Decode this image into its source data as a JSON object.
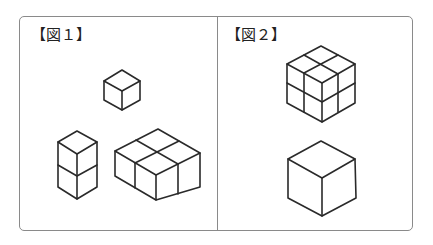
{
  "panels": [
    {
      "label": "【図１】",
      "figures": [
        {
          "name": "single-cube",
          "cubes": 1
        },
        {
          "name": "two-cube-column",
          "cubes": 2,
          "arrangement": "1x1x2"
        },
        {
          "name": "four-cube-slab",
          "cubes": 4,
          "arrangement": "2x2x1"
        }
      ]
    },
    {
      "label": "【図２】",
      "figures": [
        {
          "name": "eight-cube-block",
          "cubes": 8,
          "arrangement": "2x2x2"
        },
        {
          "name": "large-cube",
          "cubes": 1
        }
      ]
    }
  ],
  "colors": {
    "line": "#2a2a2a",
    "border": "#8a8a8a",
    "background": "#ffffff"
  }
}
